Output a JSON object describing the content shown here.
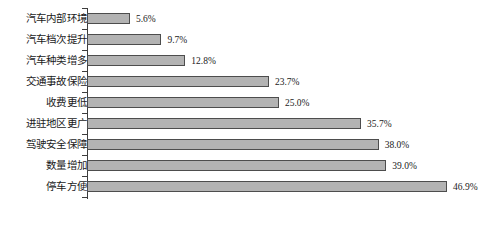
{
  "chart_data": {
    "type": "bar",
    "orientation": "horizontal",
    "title": "",
    "subtitle": "",
    "xlabel": "",
    "ylabel": "",
    "grid": false,
    "legend": false,
    "legend_position": "none",
    "xlim": [
      0,
      50
    ],
    "axis_tick_labels": [],
    "categories": [
      "汽车内部环境",
      "汽车档次提升",
      "汽车种类增多",
      "交通事故保险",
      "收费更低",
      "进驻地区更广",
      "驾驶安全保障",
      "数量增加",
      "停车方便"
    ],
    "values": [
      5.6,
      9.7,
      12.8,
      23.7,
      25.0,
      35.7,
      38.0,
      39.0,
      46.9
    ],
    "value_labels": [
      "5.6%",
      "9.7%",
      "12.8%",
      "23.7%",
      "25.0%",
      "35.7%",
      "38.0%",
      "39.0%",
      "46.9%"
    ],
    "colors": {
      "bar_fill": "#b3b3b3",
      "bar_border": "#4d4d4d",
      "axis": "#3d3d3d",
      "background": "#ffffff",
      "label_text": "#1a1a1a",
      "value_text": "#222222"
    }
  }
}
